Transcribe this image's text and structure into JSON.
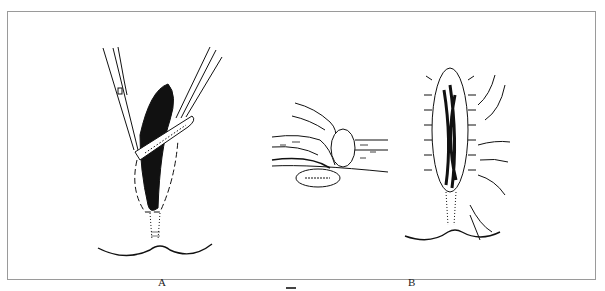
{
  "figure": {
    "panels": [
      {
        "id": "A",
        "label": "A",
        "description": "Excision of elliptical wound with forceps and scissors"
      },
      {
        "id": "B",
        "label": "B",
        "description": "Cross-section of layered suture and closed wound with interrupted sutures"
      }
    ],
    "colors": {
      "ink": "#111111",
      "frame": "#9a9a9a",
      "background": "#ffffff"
    }
  }
}
